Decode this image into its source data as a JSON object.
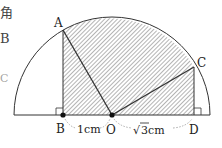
{
  "figure": {
    "colors": {
      "stroke": "#333333",
      "hatch": "#555555",
      "dashed": "#999999",
      "background": "#ffffff"
    },
    "points": {
      "A": {
        "label": "A",
        "x": 63,
        "y": 30
      },
      "B": {
        "label": "B",
        "x": 63,
        "y": 115
      },
      "O": {
        "label": "O",
        "x": 112,
        "y": 115
      },
      "C": {
        "label": "C",
        "x": 194,
        "y": 67
      },
      "D": {
        "label": "D",
        "x": 194,
        "y": 115
      }
    },
    "measurements": {
      "BO": "1cm",
      "OD_radical": "√",
      "OD_value": "3",
      "OD_unit": " cm"
    },
    "left_edge_text": [
      "角",
      "B",
      "C",
      "-"
    ]
  }
}
